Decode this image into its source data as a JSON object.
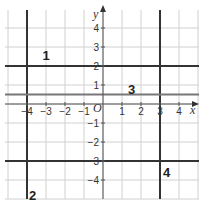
{
  "diagram": {
    "title": "",
    "grid": {
      "origin_px": {
        "x": 103,
        "y": 104
      },
      "cell_px": 19,
      "x_range": [
        -5,
        5
      ],
      "y_range": [
        -5,
        5
      ],
      "color": "#d0d0d0"
    },
    "axes": {
      "x_label": "x",
      "y_label": "y",
      "origin_label": "O",
      "x_ticks": [
        {
          "v": -4,
          "label": "−4"
        },
        {
          "v": -3,
          "label": "−3"
        },
        {
          "v": -2,
          "label": "−2"
        },
        {
          "v": -1,
          "label": "−1"
        },
        {
          "v": 1,
          "label": "1"
        },
        {
          "v": 2,
          "label": "2"
        },
        {
          "v": 3,
          "label": "3"
        },
        {
          "v": 4,
          "label": "4"
        }
      ],
      "y_ticks": [
        {
          "v": 4,
          "label": "4"
        },
        {
          "v": 3,
          "label": "3"
        },
        {
          "v": 2,
          "label": "2"
        },
        {
          "v": 1,
          "label": "1"
        },
        {
          "v": -1,
          "label": "−1"
        },
        {
          "v": -2,
          "label": "−2"
        },
        {
          "v": -3,
          "label": "−3"
        },
        {
          "v": -4,
          "label": "−4"
        }
      ]
    },
    "boundary_lines": [
      {
        "orientation": "vertical",
        "value": -4,
        "color": "#333333"
      },
      {
        "orientation": "vertical",
        "value": 3,
        "color": "#333333"
      },
      {
        "orientation": "horizontal",
        "value": 2,
        "color": "#333333"
      },
      {
        "orientation": "horizontal",
        "value": -3,
        "color": "#333333"
      },
      {
        "orientation": "horizontal",
        "value": 0.5,
        "color": "#777777"
      }
    ],
    "region_labels": [
      {
        "text": "1",
        "x": -3,
        "y": 2.6
      },
      {
        "text": "2",
        "x": -3.7,
        "y": -4.8
      },
      {
        "text": "3",
        "x": 1.5,
        "y": 0.8
      },
      {
        "text": "4",
        "x": 3.35,
        "y": -3.6
      }
    ]
  }
}
